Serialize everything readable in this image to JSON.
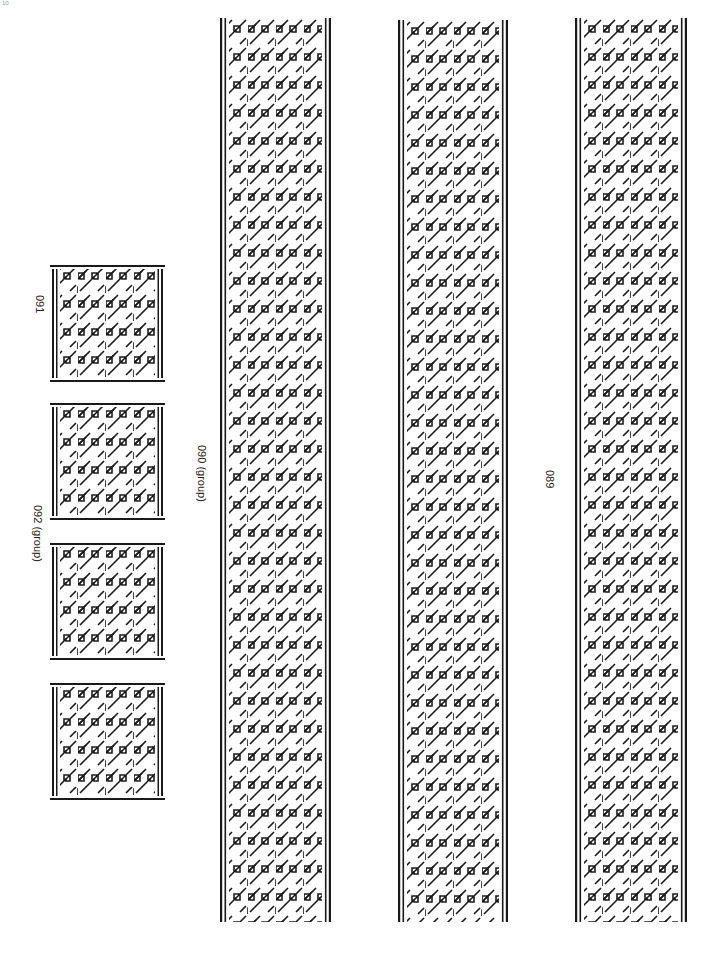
{
  "page": {
    "corner_mark": "10",
    "background": "#ffffff",
    "ink": "#1a1a1a"
  },
  "labels": {
    "tile_single": "091",
    "tile_group": "092 (group)",
    "strip_group": "090 (group)",
    "strip_single": "089"
  },
  "tiles": [
    {
      "id": "tile-091",
      "x": 50,
      "y": 265,
      "w": 115,
      "h": 117
    },
    {
      "id": "tile-092a",
      "x": 50,
      "y": 403,
      "w": 115,
      "h": 117
    },
    {
      "id": "tile-092b",
      "x": 50,
      "y": 543,
      "w": 115,
      "h": 117
    },
    {
      "id": "tile-092c",
      "x": 50,
      "y": 683,
      "w": 115,
      "h": 117
    }
  ],
  "strips": [
    {
      "id": "strip-090",
      "x": 220,
      "y": 18,
      "w": 111,
      "h": 904
    },
    {
      "id": "strip-middle",
      "x": 398,
      "y": 20,
      "w": 110,
      "h": 902
    },
    {
      "id": "strip-089",
      "x": 575,
      "y": 18,
      "w": 112,
      "h": 904
    }
  ]
}
